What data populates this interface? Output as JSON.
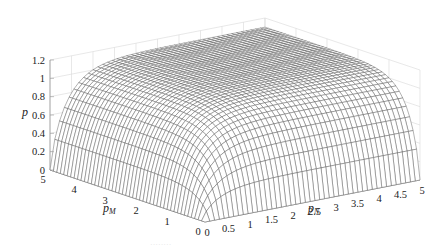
{
  "chart_data": {
    "type": "surface3d",
    "title": "",
    "xlabel": "p_N",
    "ylabel": "p_M",
    "zlabel": "p",
    "x_ticks": [
      "0",
      "0.5",
      "1",
      "1.5",
      "2",
      "2.5",
      "3",
      "3.5",
      "4",
      "4.5",
      "5"
    ],
    "y_ticks": [
      "0",
      "1",
      "2",
      "3",
      "4",
      "5"
    ],
    "z_ticks": [
      "0",
      "0.2",
      "0.4",
      "0.6",
      "0.8",
      "1",
      "1.2"
    ],
    "xlim": [
      0,
      5
    ],
    "ylim": [
      0,
      5
    ],
    "zlim": [
      0,
      1.2
    ],
    "grid": true,
    "legend": null,
    "surface_samples": {
      "p_N": [
        0,
        0.5,
        1,
        2,
        3,
        4,
        5
      ],
      "p_M": [
        0,
        0.5,
        1,
        2,
        3,
        4,
        5
      ],
      "z": [
        [
          0,
          0,
          0,
          0,
          0,
          0,
          0
        ],
        [
          0,
          0.35,
          0.55,
          0.75,
          0.85,
          0.9,
          0.92
        ],
        [
          0,
          0.55,
          0.8,
          0.95,
          1.0,
          1.03,
          1.04
        ],
        [
          0,
          0.75,
          0.95,
          1.05,
          1.07,
          1.08,
          1.09
        ],
        [
          0,
          0.85,
          1.0,
          1.07,
          1.09,
          1.1,
          1.1
        ],
        [
          0,
          0.9,
          1.03,
          1.08,
          1.1,
          1.1,
          1.1
        ],
        [
          0,
          0.92,
          1.04,
          1.09,
          1.1,
          1.1,
          1.1
        ]
      ]
    }
  },
  "labels": {
    "z_axis": "p",
    "y_axis_main": "p",
    "y_axis_sub": "M",
    "x_axis_main": "p",
    "x_axis_sub": "N"
  },
  "caption_faint": "········"
}
